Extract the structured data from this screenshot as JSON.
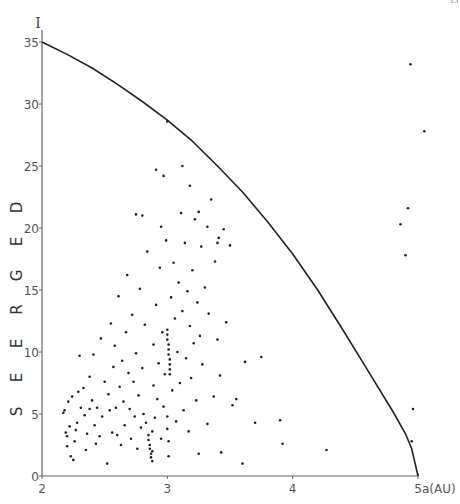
{
  "page": {
    "page_number": "15"
  },
  "chart_data": {
    "type": "scatter",
    "title": "",
    "xlabel": "a(AU)",
    "ylabel": "DEGREES",
    "y_axis_symbol": "I",
    "xlim": [
      2,
      5
    ],
    "ylim": [
      0,
      35
    ],
    "x_ticks": [
      2,
      3,
      4,
      5
    ],
    "x_tick_labels": [
      "2",
      "3",
      "4",
      "5"
    ],
    "y_ticks": [
      0,
      5,
      10,
      15,
      20,
      25,
      30,
      35
    ],
    "y_tick_labels": [
      "0",
      "5",
      "10",
      "15",
      "20",
      "25",
      "30",
      "35"
    ],
    "grid": false,
    "legend": null,
    "boundary_curve": {
      "description": "limiting curve from I=35 at a=2 down to I=0 at a=5",
      "points": [
        [
          2.0,
          35.0
        ],
        [
          2.2,
          34.0
        ],
        [
          2.4,
          32.9
        ],
        [
          2.6,
          31.6
        ],
        [
          2.8,
          30.2
        ],
        [
          3.0,
          28.7
        ],
        [
          3.2,
          27.0
        ],
        [
          3.4,
          25.0
        ],
        [
          3.6,
          22.9
        ],
        [
          3.8,
          20.5
        ],
        [
          4.0,
          17.9
        ],
        [
          4.2,
          15.0
        ],
        [
          4.4,
          11.8
        ],
        [
          4.6,
          8.5
        ],
        [
          4.8,
          5.2
        ],
        [
          4.9,
          3.4
        ],
        [
          4.95,
          2.2
        ],
        [
          5.0,
          0.0
        ]
      ]
    },
    "series": [
      {
        "name": "asteroids",
        "points": [
          [
            2.17,
            5.1
          ],
          [
            2.18,
            5.3
          ],
          [
            2.19,
            3.5
          ],
          [
            2.2,
            3.2
          ],
          [
            2.21,
            6.0
          ],
          [
            2.22,
            4.0
          ],
          [
            2.2,
            2.4
          ],
          [
            2.23,
            1.6
          ],
          [
            2.25,
            1.3
          ],
          [
            2.26,
            2.8
          ],
          [
            2.27,
            3.7
          ],
          [
            2.24,
            6.4
          ],
          [
            2.28,
            4.3
          ],
          [
            2.29,
            6.8
          ],
          [
            2.3,
            9.7
          ],
          [
            2.31,
            5.5
          ],
          [
            2.33,
            7.1
          ],
          [
            2.34,
            4.9
          ],
          [
            2.35,
            2.1
          ],
          [
            2.36,
            3.4
          ],
          [
            2.38,
            8.0
          ],
          [
            2.38,
            5.4
          ],
          [
            2.4,
            6.1
          ],
          [
            2.41,
            9.8
          ],
          [
            2.42,
            4.1
          ],
          [
            2.43,
            2.6
          ],
          [
            2.44,
            5.5
          ],
          [
            2.46,
            3.2
          ],
          [
            2.47,
            11.1
          ],
          [
            2.48,
            4.8
          ],
          [
            2.5,
            7.6
          ],
          [
            2.52,
            1.0
          ],
          [
            2.53,
            6.6
          ],
          [
            2.54,
            5.3
          ],
          [
            2.55,
            12.3
          ],
          [
            2.56,
            3.5
          ],
          [
            2.57,
            8.8
          ],
          [
            2.58,
            10.5
          ],
          [
            2.59,
            5.5
          ],
          [
            2.6,
            3.3
          ],
          [
            2.61,
            14.5
          ],
          [
            2.62,
            7.2
          ],
          [
            2.63,
            2.5
          ],
          [
            2.64,
            9.3
          ],
          [
            2.65,
            6.0
          ],
          [
            2.66,
            4.1
          ],
          [
            2.67,
            11.6
          ],
          [
            2.68,
            16.2
          ],
          [
            2.69,
            8.3
          ],
          [
            2.7,
            5.4
          ],
          [
            2.71,
            3.0
          ],
          [
            2.72,
            13.0
          ],
          [
            2.73,
            7.6
          ],
          [
            2.74,
            4.8
          ],
          [
            2.75,
            9.9
          ],
          [
            2.76,
            2.2
          ],
          [
            2.77,
            6.5
          ],
          [
            2.78,
            15.1
          ],
          [
            2.79,
            3.9
          ],
          [
            2.8,
            8.7
          ],
          [
            2.81,
            5.0
          ],
          [
            2.82,
            12.2
          ],
          [
            2.83,
            4.3
          ],
          [
            2.84,
            18.1
          ],
          [
            2.85,
            3.3
          ],
          [
            2.85,
            2.9
          ],
          [
            2.86,
            2.5
          ],
          [
            2.86,
            2.2
          ],
          [
            2.87,
            1.8
          ],
          [
            2.87,
            1.5
          ],
          [
            2.88,
            3.6
          ],
          [
            2.88,
            2.0
          ],
          [
            2.88,
            1.2
          ],
          [
            2.89,
            10.6
          ],
          [
            2.89,
            7.3
          ],
          [
            2.9,
            4.7
          ],
          [
            2.91,
            13.8
          ],
          [
            2.92,
            6.2
          ],
          [
            2.93,
            9.1
          ],
          [
            2.94,
            16.8
          ],
          [
            2.95,
            3.0
          ],
          [
            2.96,
            11.6
          ],
          [
            2.97,
            5.6
          ],
          [
            2.98,
            8.2
          ],
          [
            2.99,
            19.0
          ],
          [
            3.0,
            11.8
          ],
          [
            3.0,
            11.4
          ],
          [
            3.0,
            11.0
          ],
          [
            3.01,
            10.6
          ],
          [
            3.01,
            10.2
          ],
          [
            3.01,
            9.8
          ],
          [
            3.02,
            9.4
          ],
          [
            3.02,
            9.0
          ],
          [
            3.02,
            8.6
          ],
          [
            3.02,
            8.2
          ],
          [
            3.0,
            4.8
          ],
          [
            3.0,
            3.8
          ],
          [
            3.01,
            2.8
          ],
          [
            3.01,
            1.6
          ],
          [
            3.0,
            28.6
          ],
          [
            3.03,
            14.4
          ],
          [
            3.04,
            6.9
          ],
          [
            3.05,
            17.2
          ],
          [
            3.06,
            12.7
          ],
          [
            3.07,
            4.4
          ],
          [
            3.08,
            10.0
          ],
          [
            3.09,
            15.6
          ],
          [
            3.1,
            7.5
          ],
          [
            3.11,
            21.2
          ],
          [
            3.12,
            13.3
          ],
          [
            3.13,
            5.3
          ],
          [
            3.14,
            18.8
          ],
          [
            3.15,
            9.5
          ],
          [
            3.16,
            14.9
          ],
          [
            3.17,
            3.6
          ],
          [
            3.18,
            12.1
          ],
          [
            3.18,
            23.4
          ],
          [
            3.19,
            7.9
          ],
          [
            3.2,
            16.6
          ],
          [
            3.21,
            10.7
          ],
          [
            3.22,
            20.7
          ],
          [
            3.23,
            6.1
          ],
          [
            3.24,
            14.0
          ],
          [
            3.25,
            1.8
          ],
          [
            3.26,
            11.3
          ],
          [
            3.27,
            18.5
          ],
          [
            3.28,
            9.0
          ],
          [
            3.3,
            15.2
          ],
          [
            3.32,
            4.2
          ],
          [
            3.33,
            13.1
          ],
          [
            3.35,
            22.3
          ],
          [
            3.37,
            6.4
          ],
          [
            3.38,
            17.3
          ],
          [
            3.4,
            18.8
          ],
          [
            3.4,
            11.0
          ],
          [
            3.42,
            8.1
          ],
          [
            3.43,
            1.9
          ],
          [
            3.45,
            19.9
          ],
          [
            3.47,
            12.4
          ],
          [
            3.5,
            18.6
          ],
          [
            3.52,
            5.7
          ],
          [
            3.55,
            6.2
          ],
          [
            3.6,
            1.0
          ],
          [
            3.62,
            9.2
          ],
          [
            3.7,
            4.3
          ],
          [
            3.75,
            9.6
          ],
          [
            3.9,
            4.5
          ],
          [
            3.92,
            2.6
          ],
          [
            4.27,
            2.1
          ],
          [
            2.91,
            24.7
          ],
          [
            2.97,
            24.2
          ],
          [
            3.12,
            25.0
          ],
          [
            2.75,
            21.1
          ],
          [
            2.8,
            21.0
          ],
          [
            2.95,
            20.1
          ],
          [
            3.25,
            21.3
          ],
          [
            3.32,
            20.1
          ],
          [
            3.41,
            19.2
          ],
          [
            4.94,
            33.2
          ],
          [
            5.05,
            27.8
          ],
          [
            4.92,
            21.6
          ],
          [
            4.86,
            20.3
          ],
          [
            4.9,
            17.8
          ],
          [
            4.96,
            5.4
          ],
          [
            4.95,
            2.8
          ]
        ]
      }
    ]
  }
}
